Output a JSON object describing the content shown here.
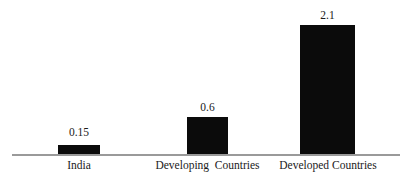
{
  "chart_data": {
    "type": "bar",
    "title": "",
    "subtitle": "",
    "xlabel": "",
    "ylabel": "",
    "categories": [
      "India",
      "Developing  Countries",
      "Developed Countries"
    ],
    "values": [
      0.15,
      0.6,
      2.1
    ],
    "value_labels": [
      "0.15",
      "0.6",
      "2.1"
    ],
    "ylim": [
      0,
      2.35
    ],
    "grid": false,
    "legend": null,
    "axis": {
      "x_axis_visible": true,
      "y_axis_visible": false,
      "x_tick_labels": [
        "India",
        "Developing  Countries",
        "Developed Countries"
      ],
      "y_tick_labels": []
    },
    "annotations": [],
    "colors": {
      "bar_fill": "#0b0b0b",
      "axis_line": "#9a9a9a",
      "text": "#1a1a1a",
      "background": "#ffffff"
    }
  }
}
